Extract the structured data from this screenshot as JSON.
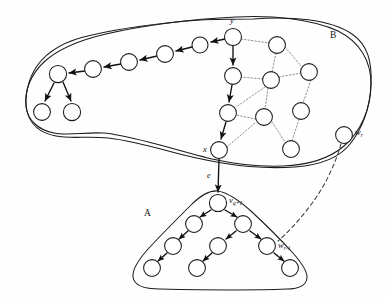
{
  "figure": {
    "background_color": "#fefefe",
    "stroke_color": "#1b1b1b",
    "dotted_edge_color": "#8d8d8d",
    "width": 387,
    "height": 300
  },
  "labels": {
    "region_b": "B",
    "region_a": "A",
    "node_y": "y",
    "node_x": "x",
    "edge_e": "e",
    "node_wr_base": "w",
    "node_wr_sub": "r",
    "node_wr1_base": "w",
    "node_wr1_sub": "r-1",
    "node_vq_base": "v",
    "node_vq_sub": "q+1"
  },
  "graph_data": {
    "type": "diagram",
    "regions": [
      {
        "id": "B",
        "label": "B",
        "label_pos": [
          330,
          35
        ],
        "description": "upper curved blob region"
      },
      {
        "id": "A",
        "label": "A",
        "label_pos": [
          147,
          212
        ],
        "description": "lower triangular rounded region"
      }
    ],
    "nodes": [
      {
        "id": "y",
        "cx": 233,
        "cy": 37,
        "r": 8.5,
        "label": "y",
        "region": "B"
      },
      {
        "id": "b1",
        "cx": 200,
        "cy": 45,
        "r": 8.0,
        "label": "",
        "region": "B"
      },
      {
        "id": "b2",
        "cx": 165,
        "cy": 54,
        "r": 8.4,
        "label": "",
        "region": "B"
      },
      {
        "id": "b3",
        "cx": 129,
        "cy": 62,
        "r": 8.4,
        "label": "",
        "region": "B"
      },
      {
        "id": "b4",
        "cx": 93,
        "cy": 69,
        "r": 8.4,
        "label": "",
        "region": "B"
      },
      {
        "id": "b5",
        "cx": 58,
        "cy": 74,
        "r": 8.6,
        "label": "",
        "region": "B"
      },
      {
        "id": "b6",
        "cx": 42,
        "cy": 112,
        "r": 8.4,
        "label": "",
        "region": "B"
      },
      {
        "id": "b7",
        "cx": 72,
        "cy": 112,
        "r": 8.6,
        "label": "",
        "region": "B"
      },
      {
        "id": "c1",
        "cx": 233,
        "cy": 76,
        "r": 8.4,
        "label": "",
        "region": "B"
      },
      {
        "id": "c2",
        "cx": 228,
        "cy": 113,
        "r": 8.4,
        "label": "",
        "region": "B"
      },
      {
        "id": "x",
        "cx": 219,
        "cy": 150,
        "r": 8.4,
        "label": "x",
        "region": "B"
      },
      {
        "id": "d1",
        "cx": 277,
        "cy": 45,
        "r": 8.4,
        "label": "",
        "region": "B"
      },
      {
        "id": "d2",
        "cx": 271,
        "cy": 80,
        "r": 8.4,
        "label": "",
        "region": "B"
      },
      {
        "id": "d3",
        "cx": 309,
        "cy": 72,
        "r": 8.4,
        "label": "",
        "region": "B"
      },
      {
        "id": "d4",
        "cx": 301,
        "cy": 111,
        "r": 8.4,
        "label": "",
        "region": "B"
      },
      {
        "id": "d5",
        "cx": 264,
        "cy": 117,
        "r": 8.4,
        "label": "",
        "region": "B"
      },
      {
        "id": "d6",
        "cx": 291,
        "cy": 149,
        "r": 8.4,
        "label": "",
        "region": "B"
      },
      {
        "id": "wr",
        "cx": 344,
        "cy": 135,
        "r": 8.4,
        "label": "w_r",
        "region": "B"
      },
      {
        "id": "vq",
        "cx": 218,
        "cy": 203,
        "r": 8.6,
        "label": "v_q+1",
        "region": "A"
      },
      {
        "id": "a1",
        "cx": 194,
        "cy": 224,
        "r": 8.4,
        "label": "",
        "region": "A"
      },
      {
        "id": "a2",
        "cx": 243,
        "cy": 224,
        "r": 8.4,
        "label": "",
        "region": "A"
      },
      {
        "id": "a3",
        "cx": 173,
        "cy": 246,
        "r": 8.4,
        "label": "",
        "region": "A"
      },
      {
        "id": "a4",
        "cx": 218,
        "cy": 246,
        "r": 8.4,
        "label": "",
        "region": "A"
      },
      {
        "id": "wr1",
        "cx": 267,
        "cy": 246,
        "r": 8.4,
        "label": "w_r-1",
        "region": "A"
      },
      {
        "id": "a6",
        "cx": 152,
        "cy": 268,
        "r": 8.4,
        "label": "",
        "region": "A"
      },
      {
        "id": "a7",
        "cx": 197,
        "cy": 268,
        "r": 8.4,
        "label": "",
        "region": "A"
      },
      {
        "id": "a8",
        "cx": 290,
        "cy": 268,
        "r": 8.4,
        "label": "",
        "region": "A"
      }
    ],
    "solid_edges": [
      [
        "y",
        "b1"
      ],
      [
        "b1",
        "b2"
      ],
      [
        "b2",
        "b3"
      ],
      [
        "b3",
        "b4"
      ],
      [
        "b4",
        "b5"
      ],
      [
        "b5",
        "b6"
      ],
      [
        "b5",
        "b7"
      ],
      [
        "y",
        "c1"
      ],
      [
        "c1",
        "c2"
      ],
      [
        "c2",
        "x"
      ],
      [
        "x",
        "vq"
      ],
      [
        "vq",
        "a1"
      ],
      [
        "vq",
        "a2"
      ],
      [
        "a1",
        "a3"
      ],
      [
        "a2",
        "a4"
      ],
      [
        "a2",
        "wr1"
      ],
      [
        "a3",
        "a6"
      ],
      [
        "a4",
        "a7"
      ],
      [
        "wr1",
        "a8"
      ]
    ],
    "dotted_edges": [
      [
        "y",
        "d1"
      ],
      [
        "d1",
        "d2"
      ],
      [
        "d1",
        "d3"
      ],
      [
        "d2",
        "d3"
      ],
      [
        "d2",
        "c1"
      ],
      [
        "d2",
        "c2"
      ],
      [
        "d2",
        "d5"
      ],
      [
        "d3",
        "d4"
      ],
      [
        "d4",
        "d6"
      ],
      [
        "d5",
        "c2"
      ],
      [
        "d5",
        "d6"
      ],
      [
        "c2",
        "d2"
      ],
      [
        "x",
        "d5"
      ]
    ],
    "dashed_edges": [
      [
        "wr",
        "wr1"
      ]
    ],
    "edge_labels": [
      {
        "id": "e",
        "label": "e",
        "pos": [
          210,
          176
        ]
      }
    ]
  }
}
